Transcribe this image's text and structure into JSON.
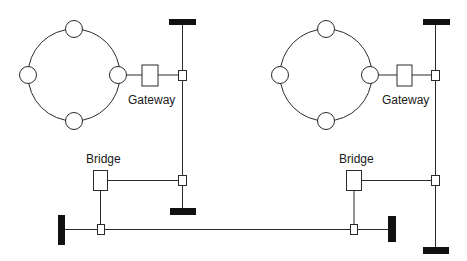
{
  "diagram": {
    "title": "",
    "colors": {
      "line": "#2a2a2a",
      "terminator": "#111111",
      "background": "#ffffff"
    },
    "left_network": {
      "ring": {
        "cx": 74,
        "cy": 75,
        "r": 46,
        "station_count": 4
      },
      "gateway_label": "Gateway",
      "bridge_label": "Bridge"
    },
    "right_network": {
      "ring": {
        "cx": 326,
        "cy": 75,
        "r": 46,
        "station_count": 4
      },
      "gateway_label": "Gateway",
      "bridge_label": "Bridge"
    },
    "buses": [
      {
        "name": "left-vertical-bus",
        "orientation": "vertical"
      },
      {
        "name": "right-vertical-bus",
        "orientation": "vertical"
      },
      {
        "name": "bottom-horizontal-bus",
        "orientation": "horizontal"
      }
    ],
    "labels": {
      "gateway_left": "Gateway",
      "gateway_right": "Gateway",
      "bridge_left": "Bridge",
      "bridge_right": "Bridge"
    }
  }
}
